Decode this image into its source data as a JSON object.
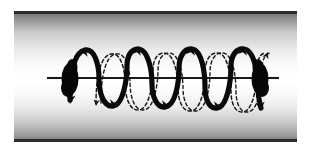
{
  "figure": {
    "width": 310,
    "height": 153,
    "background_color": "#ffffff"
  },
  "tube": {
    "name": "cylindrical-tube",
    "x": 14,
    "y": 11,
    "width": 283,
    "height": 131,
    "border_color": "#2b2b2b",
    "border_top_thickness": 3,
    "border_bottom_thickness": 3,
    "gradient_stops": [
      {
        "offset": 0.0,
        "color": "#6e6e6e"
      },
      {
        "offset": 0.06,
        "color": "#909090"
      },
      {
        "offset": 0.16,
        "color": "#c9c9c9"
      },
      {
        "offset": 0.3,
        "color": "#ececec"
      },
      {
        "offset": 0.42,
        "color": "#fbfbfb"
      },
      {
        "offset": 0.52,
        "color": "#ffffff"
      },
      {
        "offset": 0.62,
        "color": "#fbfbfb"
      },
      {
        "offset": 0.74,
        "color": "#eaeaea"
      },
      {
        "offset": 0.86,
        "color": "#c6c6c6"
      },
      {
        "offset": 0.95,
        "color": "#9a9a9a"
      },
      {
        "offset": 1.0,
        "color": "#767676"
      }
    ]
  },
  "axis": {
    "name": "tube-axis-line",
    "x_start": 47,
    "x_end": 279,
    "y": 78,
    "color": "#1a1a1a",
    "thickness": 2.1
  },
  "wave": {
    "name": "helical-wave",
    "solid_color": "#0a0a0a",
    "dashed_color": "#1a1a1a",
    "solid_stroke_width": 5.2,
    "dashed_stroke_width": 1.5,
    "dash_pattern": "3.4,2.6",
    "amplitude": 30,
    "baseline_y": 78,
    "wavelength": 46,
    "cycles": 4.5,
    "x_start": 66,
    "x_end": 262,
    "arrowhead_count": 9,
    "strand_description": "solid strand is the near side of the helix, dashed strand is the far side"
  },
  "nodes": [
    {
      "name": "left-node",
      "cx": 70,
      "cy": 79,
      "rx": 8.5,
      "ry": 16,
      "color": "#070707"
    },
    {
      "name": "right-node",
      "cx": 260,
      "cy": 79,
      "rx": 8.5,
      "ry": 16,
      "color": "#070707"
    }
  ],
  "geometry": {
    "solid_path": "M 70 100 C 70 74 74 52 85 50 C 95 48 99 66 99 78 C 99 92 103 107 113 106 C 123 105 127 80 127 66 C 127 56 131 49 138 49 C 148 49 152 70 152 84 C 152 97 157 108 165 107 C 175 106 179 84 179 68 C 179 57 184 48 192 49 C 202 50 205 73 205 87 C 205 99 209 109 217 108 C 227 107 231 82 231 66 C 231 56 236 48 244 49 C 254 50 258 73 258 88 C 258 98 260 104 261 108",
    "dashed_path": "M 96 104 C 96 78 100 56 111 54 C 121 52 125 70 125 82 C 125 96 129 111 139 110 C 149 109 153 84 153 70 C 153 60 157 53 164 53 C 174 53 178 74 178 88 C 178 101 183 112 191 111 C 201 110 205 88 205 72 C 205 61 210 52 218 53 C 228 54 231 77 231 91 C 231 103 235 113 243 112 C 253 111 257 86 257 70 C 257 60 260 53 266 53",
    "arrowheads": [
      {
        "x": 85,
        "y": 48,
        "angle": -72,
        "name": "arrowhead-up-1"
      },
      {
        "x": 113,
        "y": 107,
        "angle": 104,
        "name": "arrowhead-down-1"
      },
      {
        "x": 138,
        "y": 48,
        "angle": -74,
        "name": "arrowhead-up-2"
      },
      {
        "x": 165,
        "y": 108,
        "angle": 106,
        "name": "arrowhead-down-2"
      },
      {
        "x": 192,
        "y": 48,
        "angle": -72,
        "name": "arrowhead-up-3"
      },
      {
        "x": 217,
        "y": 109,
        "angle": 104,
        "name": "arrowhead-down-3"
      },
      {
        "x": 244,
        "y": 48,
        "angle": -74,
        "name": "arrowhead-up-4"
      },
      {
        "x": 70,
        "y": 101,
        "angle": 100,
        "name": "arrowhead-down-left-end"
      },
      {
        "x": 261,
        "y": 109,
        "angle": 84,
        "name": "arrowhead-down-right-end"
      }
    ],
    "dashed_arrowheads": [
      {
        "x": 266,
        "y": 53,
        "angle": -68,
        "name": "dashed-arrowhead-up-right"
      },
      {
        "x": 96,
        "y": 105,
        "angle": 96,
        "name": "dashed-arrowhead-down-left"
      }
    ]
  }
}
